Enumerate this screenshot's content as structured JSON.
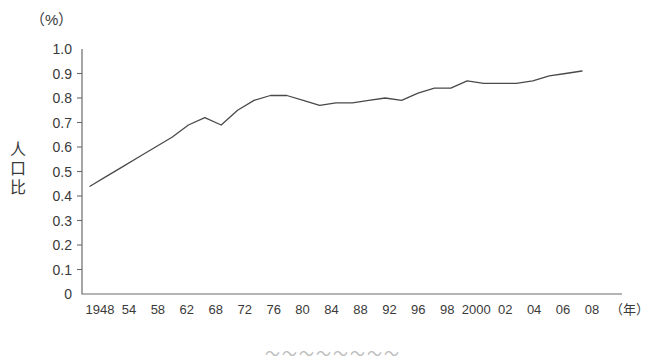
{
  "chart_data": {
    "type": "line",
    "title": "",
    "xlabel": "年",
    "ylabel": "人口比",
    "unit_label": "（%）",
    "ylim": [
      0,
      1.0
    ],
    "grid": false,
    "legend": "none",
    "y_ticks": [
      "1.0",
      "0.9",
      "0.8",
      "0.7",
      "0.6",
      "0.5",
      "0.4",
      "0.3",
      "0.2",
      "0.1",
      "0"
    ],
    "y_tick_values": [
      1.0,
      0.9,
      0.8,
      0.7,
      0.6,
      0.5,
      0.4,
      0.3,
      0.2,
      0.1,
      0
    ],
    "x_tick_labels": [
      "1948",
      "54",
      "58",
      "62",
      "68",
      "72",
      "76",
      "80",
      "84",
      "88",
      "92",
      "96",
      "98",
      "2000",
      "02",
      "04",
      "06",
      "08"
    ],
    "x": [
      1948,
      1950,
      1952,
      1954,
      1956,
      1958,
      1960,
      1962,
      1964,
      1966,
      1968,
      1970,
      1972,
      1974,
      1976,
      1978,
      1980,
      1982,
      1984,
      1986,
      1988,
      1990,
      1992,
      1994,
      1996,
      1998,
      2000,
      2002,
      2004,
      2006,
      2008
    ],
    "values": [
      0.44,
      0.48,
      0.52,
      0.56,
      0.6,
      0.64,
      0.69,
      0.72,
      0.69,
      0.75,
      0.79,
      0.81,
      0.81,
      0.79,
      0.77,
      0.78,
      0.78,
      0.79,
      0.8,
      0.79,
      0.82,
      0.84,
      0.84,
      0.87,
      0.86,
      0.86,
      0.86,
      0.87,
      0.89,
      0.9,
      0.91
    ],
    "series_name": "人口比",
    "line_color": "#4a4a4a",
    "axis_color": "#6b6b6b"
  },
  "caption": "〜〜〜〜〜〜〜〜"
}
